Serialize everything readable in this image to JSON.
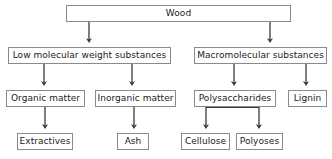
{
  "diagram": {
    "type": "flowchart",
    "orientation": "top-down",
    "colors": {
      "box_border": "#8a8a8a",
      "box_fill": "#ffffff",
      "text": "#1b1b1b",
      "connector": "#3a3a3a",
      "background": "#ffffff"
    },
    "nodes": [
      {
        "id": "wood",
        "label": "Wood",
        "level": 0,
        "x": 66,
        "y": 5,
        "w": 225,
        "h": 17
      },
      {
        "id": "low_mol",
        "label": "Low molecular weight substances",
        "level": 1,
        "x": 8,
        "y": 47,
        "w": 163,
        "h": 17
      },
      {
        "id": "macromolecular",
        "label": "Macromolecular substances",
        "level": 1,
        "x": 194,
        "y": 47,
        "w": 133,
        "h": 17
      },
      {
        "id": "organic",
        "label": "Organic matter",
        "level": 2,
        "x": 6,
        "y": 90,
        "w": 79,
        "h": 17
      },
      {
        "id": "inorganic",
        "label": "Inorganic matter",
        "level": 2,
        "x": 95,
        "y": 90,
        "w": 81,
        "h": 17
      },
      {
        "id": "polysaccharides",
        "label": "Polysaccharides",
        "level": 2,
        "x": 194,
        "y": 90,
        "w": 82,
        "h": 17
      },
      {
        "id": "lignin",
        "label": "Lignin",
        "level": 2,
        "x": 288,
        "y": 90,
        "w": 39,
        "h": 17
      },
      {
        "id": "extractives",
        "label": "Extractives",
        "level": 3,
        "x": 17,
        "y": 133,
        "w": 56,
        "h": 17
      },
      {
        "id": "ash",
        "label": "Ash",
        "level": 3,
        "x": 117,
        "y": 133,
        "w": 32,
        "h": 17
      },
      {
        "id": "cellulose",
        "label": "Cellulose",
        "level": 3,
        "x": 181,
        "y": 133,
        "w": 49,
        "h": 17
      },
      {
        "id": "polyoses",
        "label": "Polyoses",
        "level": 3,
        "x": 236,
        "y": 133,
        "w": 47,
        "h": 17
      }
    ],
    "edges": [
      {
        "id": "wood-to-low_mol",
        "from": "wood",
        "to": "low_mol",
        "style": "arrow"
      },
      {
        "id": "wood-to-macromolecular",
        "from": "wood",
        "to": "macromolecular",
        "style": "arrow"
      },
      {
        "id": "low_mol-to-organic",
        "from": "low_mol",
        "to": "organic",
        "style": "arrow"
      },
      {
        "id": "low_mol-to-inorganic",
        "from": "low_mol",
        "to": "inorganic",
        "style": "arrow"
      },
      {
        "id": "macromolecular-to-polysacch",
        "from": "macromolecular",
        "to": "polysaccharides",
        "style": "arrow"
      },
      {
        "id": "macromolecular-to-lignin",
        "from": "macromolecular",
        "to": "lignin",
        "style": "arrow"
      },
      {
        "id": "organic-to-extractives",
        "from": "organic",
        "to": "extractives",
        "style": "arrow"
      },
      {
        "id": "inorganic-to-ash",
        "from": "inorganic",
        "to": "ash",
        "style": "arrow"
      },
      {
        "id": "polysacch-to-cellulose",
        "from": "polysaccharides",
        "to": "cellulose",
        "style": "arrow"
      },
      {
        "id": "polysacch-to-polyoses",
        "from": "polysaccharides",
        "to": "polyoses",
        "style": "arrow"
      }
    ]
  }
}
